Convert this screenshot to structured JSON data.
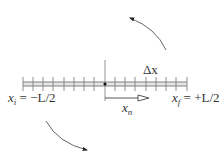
{
  "diagram": {
    "type": "discretized-1d-lattice",
    "rod": {
      "x_start": 23,
      "x_end": 187,
      "y_top": 82,
      "y_bottom": 86,
      "center_x": 105,
      "tick_count_per_side": 8
    },
    "labels": {
      "delta_x": "Δx",
      "x_i_var": "x",
      "x_i_sub": "i",
      "x_i_eq": " = −L/2",
      "x_f_var": "x",
      "x_f_sub": "f",
      "x_f_eq": " = +L/2",
      "x_n_var": "x",
      "x_n_sub": "n"
    },
    "arrows": {
      "top": "counterclockwise-rotation-arrow",
      "bottom": "clockwise-rotation-arrow",
      "position_vector": "x_n-arrow"
    },
    "colors": {
      "line": "#555555",
      "rod_fill": "#e0e0e0",
      "text": "#333333",
      "dot": "#111111"
    }
  }
}
